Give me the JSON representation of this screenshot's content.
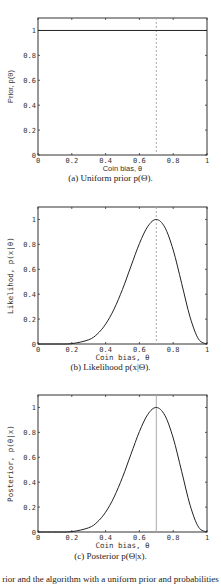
{
  "figure": {
    "bottom_text_partial": "rior and the algorithm with a uniform prior and probabilities"
  },
  "chart_data": [
    {
      "type": "line",
      "id": "a",
      "caption": "(a) Uniform prior p(Θ).",
      "xlabel": "Coin bias, θ",
      "ylabel": "Prior, p(θ)",
      "xlim": [
        0,
        1
      ],
      "ylim": [
        0,
        1.1
      ],
      "xticks": [
        "0",
        "0.2",
        "0.4",
        "0.6",
        "0.8",
        "1"
      ],
      "yticks": [
        "0",
        "0.2",
        "0.4",
        "0.6",
        "0.8",
        "1"
      ],
      "grid": false,
      "marker_line": {
        "x": 0.7,
        "style": "dashed",
        "color": "#aaaaaa"
      },
      "series": [
        {
          "name": "prior",
          "x": [
            0,
            1
          ],
          "y": [
            1,
            1
          ]
        }
      ]
    },
    {
      "type": "line",
      "id": "b",
      "caption": "(b) Likelihood p(x|Θ).",
      "xlabel": "Coin bias, θ",
      "ylabel": "Likelihod, p(x|θ)",
      "xlim": [
        0,
        1
      ],
      "ylim": [
        0,
        1.1
      ],
      "xticks": [
        "0",
        "0.2",
        "0.4",
        "0.6",
        "0.8",
        "1"
      ],
      "yticks": [
        "0",
        "0.2",
        "0.4",
        "0.6",
        "0.8",
        "1"
      ],
      "grid": false,
      "marker_line": {
        "x": 0.7,
        "style": "dashed",
        "color": "#aaaaaa"
      },
      "series": [
        {
          "name": "likelihood",
          "x": [
            0,
            0.1,
            0.2,
            0.3,
            0.35,
            0.4,
            0.45,
            0.5,
            0.55,
            0.6,
            0.65,
            0.7,
            0.75,
            0.8,
            0.85,
            0.9,
            0.95,
            1.0
          ],
          "y": [
            0,
            0,
            0.003,
            0.034,
            0.079,
            0.159,
            0.28,
            0.439,
            0.624,
            0.806,
            0.945,
            1.0,
            0.938,
            0.755,
            0.487,
            0.215,
            0.039,
            0
          ]
        }
      ]
    },
    {
      "type": "line",
      "id": "c",
      "caption": "(c) Posterior p(Θ|x).",
      "xlabel": "Coin bias, θ",
      "ylabel": "Posterior, p(θ|x)",
      "xlim": [
        0,
        1
      ],
      "ylim": [
        0,
        1.1
      ],
      "xticks": [
        "0",
        "0.2",
        "0.4",
        "0.6",
        "0.8",
        "1"
      ],
      "yticks": [
        "0",
        "0.2",
        "0.4",
        "0.6",
        "0.8",
        "1"
      ],
      "grid": false,
      "marker_line": {
        "x": 0.7,
        "style": "solid",
        "color": "#aaaaaa"
      },
      "series": [
        {
          "name": "posterior",
          "x": [
            0,
            0.1,
            0.2,
            0.3,
            0.35,
            0.4,
            0.45,
            0.5,
            0.55,
            0.6,
            0.65,
            0.7,
            0.75,
            0.8,
            0.85,
            0.9,
            0.95,
            1.0
          ],
          "y": [
            0,
            0,
            0.003,
            0.034,
            0.079,
            0.159,
            0.28,
            0.439,
            0.624,
            0.806,
            0.945,
            1.0,
            0.938,
            0.755,
            0.487,
            0.215,
            0.039,
            0
          ]
        }
      ]
    }
  ]
}
